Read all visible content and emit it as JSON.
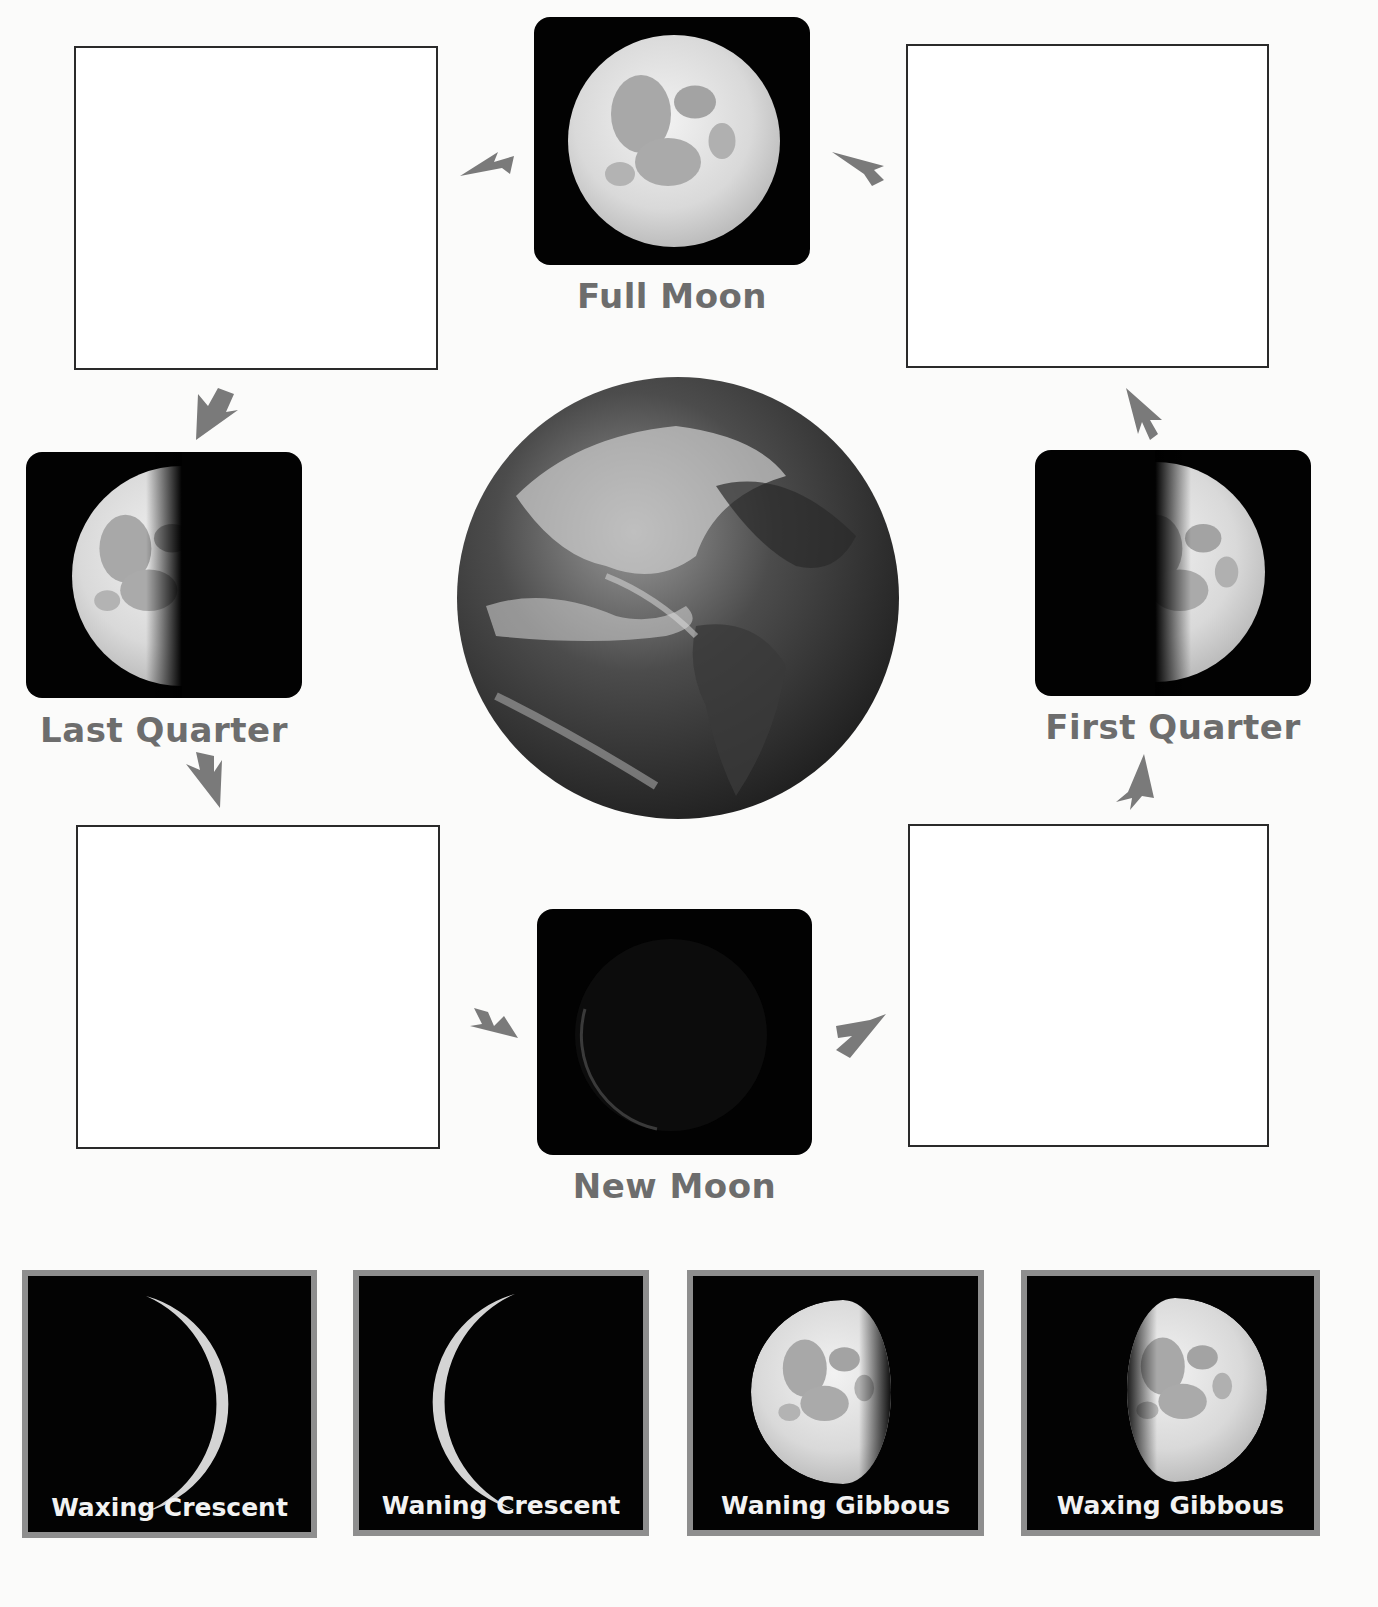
{
  "diagram": {
    "center": {
      "name": "Earth"
    },
    "arrow_color": "#7a7a7a",
    "label_color": "#6d6d6d",
    "card_border_color": "#8e8e8e",
    "labeled_phases": [
      {
        "id": "full-moon",
        "label": "Full Moon",
        "illumination": "full"
      },
      {
        "id": "last-quarter",
        "label": "Last Quarter",
        "illumination": "left-half"
      },
      {
        "id": "first-quarter",
        "label": "First Quarter",
        "illumination": "right-half"
      },
      {
        "id": "new-moon",
        "label": "New Moon",
        "illumination": "dark"
      }
    ],
    "blank_boxes": [
      {
        "id": "blank-top-left",
        "position": "between Full Moon and Last Quarter"
      },
      {
        "id": "blank-top-right",
        "position": "between First Quarter and Full Moon"
      },
      {
        "id": "blank-bottom-left",
        "position": "between Last Quarter and New Moon"
      },
      {
        "id": "blank-bottom-right",
        "position": "between New Moon and First Quarter"
      }
    ],
    "answer_cards": [
      {
        "id": "card-waxing-crescent",
        "label": "Waxing Crescent",
        "illumination": "right-crescent"
      },
      {
        "id": "card-waning-crescent",
        "label": "Waning Crescent",
        "illumination": "left-crescent"
      },
      {
        "id": "card-waning-gibbous",
        "label": "Waning Gibbous",
        "illumination": "left-gibbous"
      },
      {
        "id": "card-waxing-gibbous",
        "label": "Waxing Gibbous",
        "illumination": "right-gibbous"
      }
    ]
  }
}
